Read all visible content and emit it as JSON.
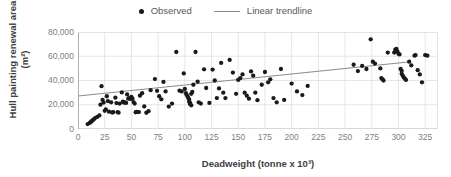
{
  "legend": {
    "position": "top-center",
    "entries": [
      {
        "label": "Observed",
        "marker": "dot",
        "color": "#1a1a1a"
      },
      {
        "label": "Linear trendline",
        "marker": "line",
        "color": "#8c8c8c"
      }
    ]
  },
  "chart_data": {
    "type": "scatter",
    "title": "",
    "xlabel": "Deadweight (tonne x 10³)",
    "ylabel": "Hull painting renewal area (m²)",
    "xlim": [
      0,
      337
    ],
    "ylim": [
      0,
      80000
    ],
    "xticks": [
      0,
      25,
      50,
      75,
      100,
      125,
      150,
      175,
      200,
      225,
      250,
      275,
      300,
      325
    ],
    "yticks": [
      0,
      20000,
      40000,
      60000,
      80000
    ],
    "ytick_labels": [
      "0",
      "20,000",
      "40,000",
      "60,000",
      "80,000"
    ],
    "grid": {
      "x": true,
      "y": true,
      "color": "#e0e0e0"
    },
    "series": [
      {
        "name": "Observed",
        "marker": "dot",
        "color": "#1a1a1a",
        "points": [
          [
            9,
            4100
          ],
          [
            11,
            5000
          ],
          [
            12,
            5800
          ],
          [
            13,
            6600
          ],
          [
            14,
            7400
          ],
          [
            15,
            8200
          ],
          [
            16,
            9000
          ],
          [
            18,
            10000
          ],
          [
            20,
            11200
          ],
          [
            21,
            20100
          ],
          [
            22,
            35300
          ],
          [
            23,
            24000
          ],
          [
            24,
            21800
          ],
          [
            25,
            15000
          ],
          [
            26,
            16200
          ],
          [
            27,
            27000
          ],
          [
            28,
            23000
          ],
          [
            29,
            14300
          ],
          [
            31,
            22000
          ],
          [
            32,
            13600
          ],
          [
            33,
            13900
          ],
          [
            35,
            25800
          ],
          [
            36,
            21400
          ],
          [
            37,
            14000
          ],
          [
            38,
            13500
          ],
          [
            39,
            21000
          ],
          [
            41,
            30200
          ],
          [
            42,
            22500
          ],
          [
            43,
            21800
          ],
          [
            44,
            22000
          ],
          [
            45,
            21500
          ],
          [
            46,
            28500
          ],
          [
            47,
            25000
          ],
          [
            48,
            25500
          ],
          [
            49,
            24800
          ],
          [
            50,
            26500
          ],
          [
            51,
            25000
          ],
          [
            52,
            22200
          ],
          [
            53,
            21000
          ],
          [
            54,
            13800
          ],
          [
            55,
            14100
          ],
          [
            57,
            14000
          ],
          [
            58,
            27500
          ],
          [
            60,
            29500
          ],
          [
            62,
            18600
          ],
          [
            64,
            13400
          ],
          [
            66,
            14700
          ],
          [
            68,
            32000
          ],
          [
            72,
            41200
          ],
          [
            74,
            31500
          ],
          [
            76,
            27000
          ],
          [
            78,
            24500
          ],
          [
            80,
            38800
          ],
          [
            82,
            31000
          ],
          [
            85,
            18500
          ],
          [
            88,
            21000
          ],
          [
            92,
            63500
          ],
          [
            95,
            31600
          ],
          [
            97,
            31000
          ],
          [
            99,
            45800
          ],
          [
            100,
            33000
          ],
          [
            101,
            29500
          ],
          [
            102,
            27800
          ],
          [
            103,
            26000
          ],
          [
            104,
            24500
          ],
          [
            104,
            22500
          ],
          [
            105,
            21500
          ],
          [
            105,
            20500
          ],
          [
            106,
            19500
          ],
          [
            106,
            29000
          ],
          [
            107,
            30500
          ],
          [
            108,
            36500
          ],
          [
            110,
            63500
          ],
          [
            112,
            39000
          ],
          [
            113,
            22000
          ],
          [
            115,
            21000
          ],
          [
            118,
            49200
          ],
          [
            120,
            33800
          ],
          [
            123,
            21500
          ],
          [
            126,
            49000
          ],
          [
            128,
            40000
          ],
          [
            130,
            25500
          ],
          [
            132,
            33500
          ],
          [
            134,
            54500
          ],
          [
            136,
            30000
          ],
          [
            138,
            25500
          ],
          [
            142,
            57000
          ],
          [
            145,
            46500
          ],
          [
            148,
            29000
          ],
          [
            150,
            40500
          ],
          [
            152,
            42000
          ],
          [
            154,
            45000
          ],
          [
            156,
            30000
          ],
          [
            158,
            27500
          ],
          [
            160,
            25000
          ],
          [
            162,
            47500
          ],
          [
            164,
            44000
          ],
          [
            166,
            30000
          ],
          [
            168,
            23800
          ],
          [
            172,
            36500
          ],
          [
            175,
            47000
          ],
          [
            178,
            38500
          ],
          [
            180,
            41000
          ],
          [
            183,
            25500
          ],
          [
            186,
            22000
          ],
          [
            190,
            49500
          ],
          [
            193,
            24000
          ],
          [
            200,
            37500
          ],
          [
            205,
            31000
          ],
          [
            210,
            28000
          ],
          [
            215,
            35500
          ],
          [
            258,
            53000
          ],
          [
            262,
            47800
          ],
          [
            266,
            52000
          ],
          [
            270,
            49500
          ],
          [
            274,
            74000
          ],
          [
            276,
            55500
          ],
          [
            278,
            54000
          ],
          [
            283,
            50000
          ],
          [
            284,
            42000
          ],
          [
            285,
            41000
          ],
          [
            286,
            40000
          ],
          [
            290,
            63000
          ],
          [
            296,
            63000
          ],
          [
            297,
            65500
          ],
          [
            298,
            66000
          ],
          [
            299,
            64000
          ],
          [
            300,
            62000
          ],
          [
            301,
            61500
          ],
          [
            302,
            49500
          ],
          [
            303,
            48000
          ],
          [
            303,
            45500
          ],
          [
            304,
            44000
          ],
          [
            305,
            42500
          ],
          [
            306,
            41500
          ],
          [
            307,
            40500
          ],
          [
            310,
            55500
          ],
          [
            312,
            52500
          ],
          [
            315,
            60500
          ],
          [
            316,
            61000
          ],
          [
            318,
            48500
          ],
          [
            320,
            45000
          ],
          [
            322,
            38500
          ],
          [
            325,
            61000
          ],
          [
            327,
            60500
          ]
        ]
      }
    ],
    "trendline": {
      "name": "Linear trendline",
      "color": "#8c8c8c",
      "x_start": 0,
      "y_start": 27200,
      "x_end": 309,
      "y_end": 55300
    }
  }
}
